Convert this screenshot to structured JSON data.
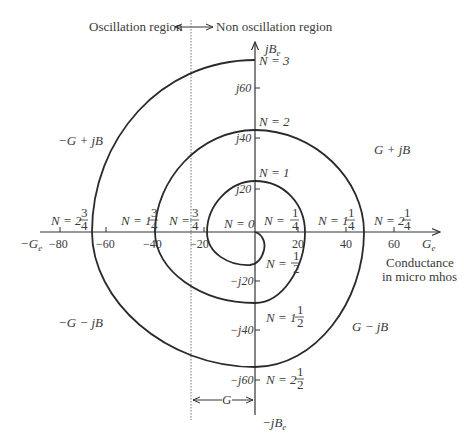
{
  "header": {
    "left_region": "Oscillation region",
    "right_region": "Non oscillation region"
  },
  "axes": {
    "horizontal_positive": "G",
    "horizontal_positive_sub": "e",
    "horizontal_negative": "−G",
    "horizontal_negative_sub": "e",
    "vertical_positive": "jB",
    "vertical_positive_sub": "e",
    "vertical_negative": "−jB",
    "vertical_negative_sub": "e",
    "unit_label_line1": "Conductance",
    "unit_label_line2": "in micro mhos",
    "x_ticks": [
      "−80",
      "−60",
      "−40",
      "−20",
      "20",
      "40",
      "60"
    ],
    "y_ticks": [
      "j60",
      "j40",
      "j20",
      "−j20",
      "−j40",
      "−j60"
    ]
  },
  "quadrants": {
    "q1": "G + jB",
    "q2": "−G + jB",
    "q3": "−G − jB",
    "q4": "G − jB"
  },
  "spiral_labels": {
    "n0": "N = 0",
    "n_quarter": {
      "prefix": "N = ",
      "num": "1",
      "den": "4"
    },
    "n_half": {
      "prefix": "N = ",
      "num": "1",
      "den": "2"
    },
    "n_three_quarter": {
      "prefix": "N = ",
      "num": "3",
      "den": "4"
    },
    "n1": "N = 1",
    "n1_quarter": {
      "prefix": "N = 1",
      "num": "1",
      "den": "4"
    },
    "n1_half": {
      "prefix": "N = 1",
      "num": "1",
      "den": "2"
    },
    "n1_three_quarter": {
      "prefix": "N = 1",
      "num": "3",
      "den": "4"
    },
    "n2": "N = 2",
    "n2_quarter": {
      "prefix": "N = 2",
      "num": "1",
      "den": "4"
    },
    "n2_half": {
      "prefix": "N = 2",
      "num": "1",
      "den": "2"
    },
    "n2_three_quarter": {
      "prefix": "N = 2",
      "num": "3",
      "den": "4"
    },
    "n3": "N = 3"
  },
  "dimension": {
    "g_label": "G"
  }
}
